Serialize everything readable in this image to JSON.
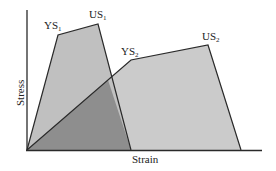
{
  "diagram": {
    "type": "stress-strain comparison",
    "x_axis_label": "Strain",
    "y_axis_label": "Stress",
    "curves": [
      {
        "name": "Material 1",
        "points": [
          {
            "label": "YS",
            "sub": "1"
          },
          {
            "label": "US",
            "sub": "1"
          }
        ]
      },
      {
        "name": "Material 2",
        "points": [
          {
            "label": "YS",
            "sub": "2"
          },
          {
            "label": "US",
            "sub": "2"
          }
        ]
      }
    ],
    "colors": {
      "fill_light": "#c4c4c4",
      "fill_overlap": "#8e8e8e",
      "line": "#2a2a2a",
      "background": "#ffffff"
    }
  }
}
